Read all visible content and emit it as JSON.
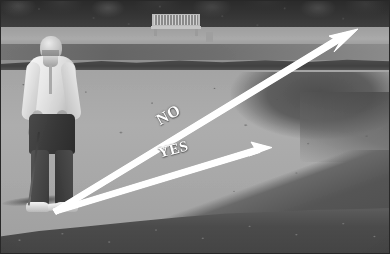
{
  "photo": {
    "subject": "golf-bunker-instruction",
    "width": 390,
    "height": 254,
    "color_mode": "grayscale"
  },
  "annotations": {
    "no_label": "NO",
    "yes_label": "YES",
    "label_color": "#fdfdfd",
    "arrow_color": "#ffffff"
  },
  "arrows": {
    "origin": {
      "x": 53,
      "y": 207
    },
    "no": {
      "label": "NO",
      "from_x": 53,
      "from_y": 207,
      "to_x": 357,
      "to_y": 30,
      "angle_deg": -30,
      "meaning": "steep long line out of the bunker"
    },
    "yes": {
      "label": "YES",
      "from_x": 53,
      "from_y": 207,
      "to_x": 270,
      "to_y": 148,
      "angle_deg": -15,
      "meaning": "shallow short line out of the bunker"
    }
  },
  "scene": {
    "golfer": "golfer-addressing-ball-in-bunker",
    "bench": "park-bench",
    "treeline": "background-tree-line",
    "fairway": "fairway-band",
    "sand": "sand-bunker",
    "grass": "foreground-grass"
  }
}
